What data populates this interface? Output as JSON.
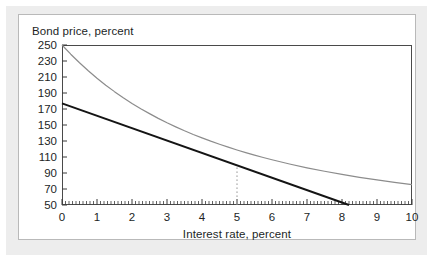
{
  "figure": {
    "frame_color": "#ededed",
    "panel_background": "#ffffff",
    "panel_border_color": "#b9b9b9"
  },
  "chart_data": {
    "type": "line",
    "title": "",
    "xlabel": "Interest rate, percent",
    "ylabel": "Bond price, percent",
    "xlim": [
      0,
      10
    ],
    "ylim": [
      50,
      250
    ],
    "xticks": [
      0,
      1,
      2,
      3,
      4,
      5,
      6,
      7,
      8,
      9,
      10
    ],
    "xtick_labels": [
      "0",
      "1",
      "2",
      "3",
      "4",
      "5",
      "6",
      "7",
      "8",
      "9",
      "10"
    ],
    "yticks": [
      50,
      70,
      90,
      110,
      130,
      150,
      170,
      190,
      210,
      230,
      250
    ],
    "ytick_labels": [
      "50",
      "70",
      "90",
      "110",
      "130",
      "150",
      "170",
      "190",
      "210",
      "230",
      "250"
    ],
    "grid": false,
    "legend": "none",
    "minor_xticks_per_unit": 10,
    "series": [
      {
        "name": "bond-price-curve",
        "style": "solid",
        "color": "#8c8c8c",
        "width": 1.2,
        "x": [
          0,
          0.25,
          0.5,
          0.75,
          1,
          1.25,
          1.5,
          1.75,
          2,
          2.25,
          2.5,
          2.75,
          3,
          3.25,
          3.5,
          3.75,
          4,
          4.25,
          4.5,
          4.75,
          5,
          5.25,
          5.5,
          5.75,
          6,
          6.5,
          7,
          7.5,
          8,
          8.5,
          9,
          9.5,
          10
        ],
        "y": [
          250,
          238.5,
          227.8,
          217.8,
          208.5,
          199.8,
          191.7,
          184.1,
          177,
          170.4,
          164.2,
          158.3,
          152.8,
          147.7,
          142.8,
          138.2,
          133.9,
          129.8,
          126,
          122.3,
          118.8,
          115.5,
          112.4,
          109.4,
          106.6,
          101.3,
          96.5,
          92.2,
          88.2,
          84.6,
          81.3,
          78.3,
          75.5
        ]
      },
      {
        "name": "tangent-line",
        "style": "solid",
        "color": "#141414",
        "width": 2.0,
        "x": [
          0,
          8.2
        ],
        "y": [
          177,
          50
        ]
      },
      {
        "name": "reference-dotted-line",
        "style": "dotted",
        "color": "#9a9a9a",
        "width": 1,
        "x": [
          5,
          5
        ],
        "y": [
          50,
          100
        ]
      }
    ],
    "annotations": [
      {
        "name": "tangency-point",
        "x": 5,
        "y": 100,
        "label": ""
      }
    ]
  }
}
